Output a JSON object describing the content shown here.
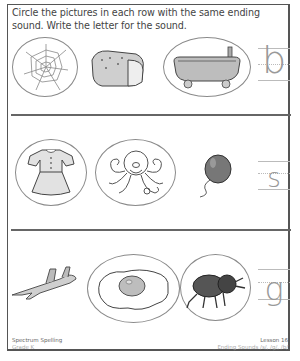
{
  "worksheet": {
    "instructions": "Circle the pictures in each row with the same ending sound. Write the letter for the sound.",
    "rows": [
      {
        "pictures": [
          {
            "name": "web",
            "icon": "spider-web-icon",
            "circled": true
          },
          {
            "name": "bread",
            "icon": "bread-icon",
            "circled": false
          },
          {
            "name": "tub",
            "icon": "bathtub-icon",
            "circled": true
          }
        ],
        "answer_letter": "b"
      },
      {
        "pictures": [
          {
            "name": "dress",
            "icon": "dress-icon",
            "circled": true
          },
          {
            "name": "octopus",
            "icon": "octopus-icon",
            "circled": true
          },
          {
            "name": "balloon",
            "icon": "balloon-icon",
            "circled": false
          }
        ],
        "answer_letter": "s"
      },
      {
        "pictures": [
          {
            "name": "jet",
            "icon": "jet-icon",
            "circled": false
          },
          {
            "name": "egg",
            "icon": "fried-egg-icon",
            "circled": true
          },
          {
            "name": "bug",
            "icon": "bug-icon",
            "circled": true
          }
        ],
        "answer_letter": "g"
      }
    ]
  },
  "footer": {
    "left_title": "Spectrum Spelling",
    "left_sub": "Grade K",
    "right_title": "Lesson 16",
    "right_sub": "Ending Sounds /s/, /g/, /b/"
  },
  "colors": {
    "border": "#555555",
    "ring": "#8a8a8a",
    "guide_letter": "#999999"
  }
}
